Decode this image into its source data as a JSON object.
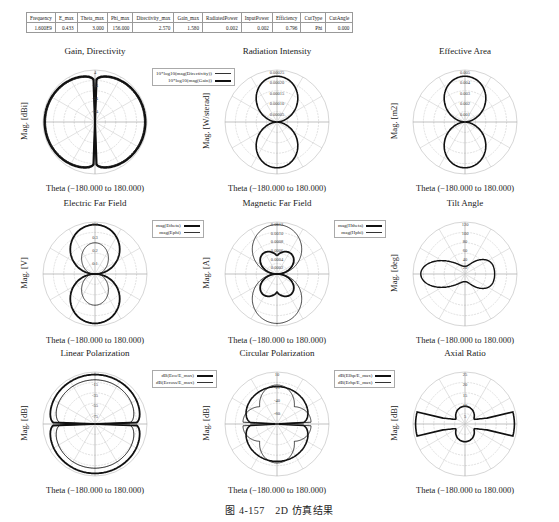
{
  "table": {
    "headers": [
      "Frequency",
      "E_max",
      "Theta_max",
      "Phi_max",
      "Directivity_max",
      "Gain_max",
      "RadiatedPower",
      "InputPower",
      "Efficiency",
      "CutType",
      "CutAngle"
    ],
    "row": [
      "1.600E9",
      "0.433",
      "3.000",
      "156.000",
      "2.570",
      "1.580",
      "0.002",
      "0.002",
      "0.796",
      "Phi",
      "0.000"
    ]
  },
  "caption": "图 4-157　2D 仿真结果",
  "chart_data": [
    {
      "type": "polar",
      "title": "Gain, Directivity",
      "ylabel": "Mag. [dBi]",
      "xlabel": "Theta (−180.000 to 180.000)",
      "ticks": [
        "4",
        "-14",
        "-24",
        "-34"
      ],
      "legend": [
        "10*log10(mag(Directivity))",
        "10*log10(mag(Gain))"
      ],
      "shape": "dipole-db"
    },
    {
      "type": "polar",
      "title": "Radiation Intensity",
      "ylabel": "Mag. [W/sterad]",
      "xlabel": "Theta (−180.000 to 180.000)",
      "ticks": [
        "0.00025",
        "0.00020",
        "0.00015",
        "0.00010",
        "0.00005"
      ],
      "legend": [],
      "shape": "dipole-lin"
    },
    {
      "type": "polar",
      "title": "Effective Area",
      "ylabel": "Mag. [m2]",
      "xlabel": "Theta (−180.000 to 180.000)",
      "ticks": [
        "0.005",
        "0.004",
        "0.003",
        "0.002",
        "0.001"
      ],
      "legend": [],
      "shape": "dipole-lin"
    },
    {
      "type": "polar",
      "title": "Electric Far Field",
      "ylabel": "Mag. [V]",
      "xlabel": "Theta (−180.000 to 180.000)",
      "ticks": [
        "0.4",
        "0.3",
        "0.2",
        "0.1"
      ],
      "legend": [
        "mag(Etheta)",
        "mag(Ephi)"
      ],
      "shape": "efield"
    },
    {
      "type": "polar",
      "title": "Magnetic Far Field",
      "ylabel": "Mag. [A]",
      "xlabel": "Theta (−180.000 to 180.000)",
      "ticks": [
        "0.0012",
        "0.0010",
        "0.0008",
        "0.0006",
        "0.0004",
        "0.0002"
      ],
      "legend": [
        "mag(Htheta)",
        "mag(Hphi)"
      ],
      "shape": "hfield"
    },
    {
      "type": "polar",
      "title": "Tilt Angle",
      "ylabel": "Mag. [deg]",
      "xlabel": "Theta (−180.000 to 180.000)",
      "ticks": [
        "120",
        "100",
        "80",
        "60",
        "40",
        "20"
      ],
      "legend": [],
      "shape": "tilt"
    },
    {
      "type": "polar",
      "title": "Linear Polarization",
      "ylabel": "Mag. [dB]",
      "xlabel": "Theta (−180.000 to 180.000)",
      "ticks": [
        "5",
        "-15",
        "-35",
        "-55",
        "-75"
      ],
      "legend": [
        "dB(Eco/E_max)",
        "dB(Ecross/E_max)"
      ],
      "shape": "linpol"
    },
    {
      "type": "polar",
      "title": "Circular Polarization",
      "ylabel": "Mag. [dB]",
      "xlabel": "Theta (−180.000 to 180.000)",
      "ticks": [
        "10",
        "-21",
        "-40",
        "-60"
      ],
      "legend": [
        "dB(Elhp/E_max)",
        "dB(Erhp/E_max)"
      ],
      "shape": "circpol"
    },
    {
      "type": "polar",
      "title": "Axial Ratio",
      "ylabel": "Mag. [dB]",
      "xlabel": "Theta (−180.000 to 180.000)",
      "ticks": [
        "25",
        "20",
        "15",
        "10",
        "5"
      ],
      "legend": [],
      "shape": "axial"
    }
  ]
}
